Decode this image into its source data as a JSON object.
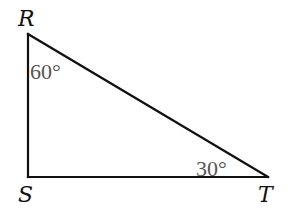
{
  "diagram": {
    "type": "right-triangle",
    "vertices": {
      "R": {
        "label": "R",
        "x": 28,
        "y": 34
      },
      "S": {
        "label": "S",
        "x": 28,
        "y": 177
      },
      "T": {
        "label": "T",
        "x": 268,
        "y": 177
      }
    },
    "angles": {
      "R": {
        "label": "60°"
      },
      "T": {
        "label": "30°"
      }
    },
    "colors": {
      "stroke": "#111111",
      "vertex_label": "#111111",
      "angle_label": "#555555",
      "background": "#ffffff"
    }
  }
}
